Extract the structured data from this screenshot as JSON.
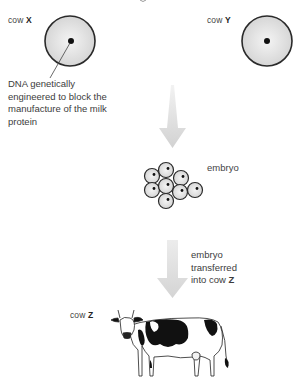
{
  "diagram": {
    "top_fragment": "g",
    "cow_x": {
      "prefix": "cow",
      "letter": "X"
    },
    "cow_y": {
      "prefix": "cow",
      "letter": "Y"
    },
    "cow_z": {
      "prefix": "cow",
      "letter": "Z"
    },
    "dna_annotation": [
      "DNA genetically",
      "engineered to block the",
      "manufacture of the milk",
      "protein"
    ],
    "embryo_label": "embryo",
    "transfer_label": {
      "line1": "embryo",
      "line2": "transferred",
      "line3_prefix": "into cow",
      "line3_letter": "Z"
    },
    "colors": {
      "cell_fill": "#e4e4e4",
      "cell_stroke": "#2a2a2a",
      "arrow": "#d9d9d9",
      "nucleus": "#111111"
    }
  }
}
